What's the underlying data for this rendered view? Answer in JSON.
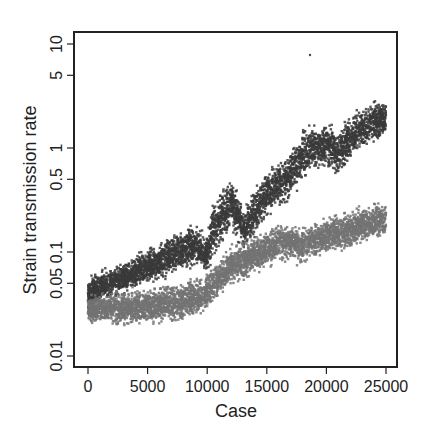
{
  "chart_data": {
    "type": "scatter",
    "title": "",
    "xlabel": "Case",
    "ylabel": "Strain transmission rate",
    "xlim": [
      0,
      25000
    ],
    "ylim": [
      0.008,
      12
    ],
    "yscale": "log",
    "grid": false,
    "legend": null,
    "x_ticks": [
      0,
      5000,
      10000,
      15000,
      20000,
      25000
    ],
    "x_tick_labels": [
      "0",
      "5000",
      "10000",
      "15000",
      "20000",
      "25000"
    ],
    "y_ticks": [
      0.01,
      0.05,
      0.1,
      0.5,
      1,
      5,
      10
    ],
    "y_tick_labels": [
      "0.01",
      "0.05",
      "0.1",
      "0.5",
      "1",
      "5",
      "10"
    ],
    "x": [
      0,
      1000,
      2500,
      4000,
      5000,
      6500,
      7500,
      9000,
      10000,
      10500,
      11000,
      12000,
      13000,
      14000,
      15000,
      16000,
      17000,
      18000,
      19000,
      20000,
      21000,
      22000,
      23000,
      24000,
      25000
    ],
    "series": [
      {
        "name": "dark series",
        "color": "#3a3a3a",
        "values": [
          0.035,
          0.042,
          0.05,
          0.06,
          0.07,
          0.085,
          0.1,
          0.12,
          0.09,
          0.15,
          0.2,
          0.35,
          0.15,
          0.25,
          0.4,
          0.45,
          0.6,
          0.9,
          1.0,
          1.1,
          0.9,
          1.3,
          1.6,
          1.8,
          2.0
        ],
        "band_low": [
          0.025,
          0.03,
          0.035,
          0.04,
          0.045,
          0.05,
          0.06,
          0.07,
          0.06,
          0.08,
          0.1,
          0.15,
          0.09,
          0.12,
          0.2,
          0.25,
          0.3,
          0.45,
          0.55,
          0.6,
          0.45,
          0.7,
          0.9,
          1.0,
          1.2
        ],
        "band_high": [
          0.06,
          0.07,
          0.08,
          0.1,
          0.12,
          0.14,
          0.17,
          0.2,
          0.15,
          0.35,
          0.4,
          0.6,
          0.3,
          0.45,
          0.7,
          0.8,
          1.1,
          1.6,
          1.9,
          2.0,
          1.7,
          2.3,
          2.8,
          3.2,
          3.0
        ]
      },
      {
        "name": "light series",
        "color": "#737373",
        "values": [
          0.025,
          0.026,
          0.028,
          0.029,
          0.03,
          0.031,
          0.032,
          0.035,
          0.04,
          0.045,
          0.055,
          0.07,
          0.08,
          0.1,
          0.1,
          0.12,
          0.12,
          0.11,
          0.13,
          0.14,
          0.15,
          0.16,
          0.17,
          0.19,
          0.2
        ],
        "band_low": [
          0.02,
          0.019,
          0.018,
          0.018,
          0.018,
          0.019,
          0.019,
          0.021,
          0.025,
          0.03,
          0.035,
          0.045,
          0.05,
          0.06,
          0.065,
          0.075,
          0.075,
          0.07,
          0.08,
          0.09,
          0.095,
          0.1,
          0.11,
          0.12,
          0.13
        ],
        "band_high": [
          0.04,
          0.042,
          0.045,
          0.047,
          0.05,
          0.052,
          0.055,
          0.06,
          0.07,
          0.08,
          0.09,
          0.12,
          0.13,
          0.15,
          0.17,
          0.2,
          0.22,
          0.18,
          0.22,
          0.24,
          0.25,
          0.27,
          0.3,
          0.32,
          0.32
        ]
      }
    ],
    "annotations": []
  }
}
